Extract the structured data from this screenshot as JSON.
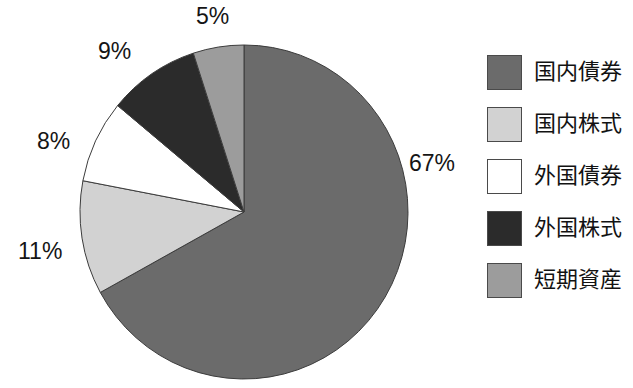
{
  "chart_data": {
    "type": "pie",
    "title": "",
    "subtitle": "",
    "xlabel": "",
    "ylabel": "",
    "legend_position": "right",
    "grid": false,
    "start_angle_deg": 0,
    "direction": "clockwise",
    "categories": [
      "国内債券",
      "国内株式",
      "外国債券",
      "外国株式",
      "短期資産"
    ],
    "values": [
      67,
      11,
      8,
      9,
      5
    ],
    "value_unit": "%",
    "data_labels": [
      "67%",
      "11%",
      "8%",
      "9%",
      "5%"
    ],
    "slice_colors": [
      "#6b6b6b",
      "#d2d2d2",
      "#ffffff",
      "#2b2b2b",
      "#9c9c9c"
    ],
    "slices": [
      {
        "label": "国内債券",
        "value": 67,
        "data_label": "67%",
        "color": "#6b6b6b"
      },
      {
        "label": "国内株式",
        "value": 11,
        "data_label": "11%",
        "color": "#d2d2d2"
      },
      {
        "label": "外国債券",
        "value": 8,
        "data_label": "8%",
        "color": "#ffffff"
      },
      {
        "label": "外国株式",
        "value": 9,
        "data_label": "9%",
        "color": "#2b2b2b"
      },
      {
        "label": "短期資産",
        "value": 5,
        "data_label": "5%",
        "color": "#9c9c9c"
      }
    ]
  },
  "chart": {
    "labels": {
      "pct_67": "67%",
      "pct_11": "11%",
      "pct_8": "8%",
      "pct_9": "9%",
      "pct_5": "5%"
    }
  },
  "legend": {
    "items": [
      {
        "label": "国内債券",
        "color": "#6b6b6b",
        "swatch_name": "legend-swatch-domestic-bonds"
      },
      {
        "label": "国内株式",
        "color": "#d2d2d2",
        "swatch_name": "legend-swatch-domestic-stocks"
      },
      {
        "label": "外国債券",
        "color": "#ffffff",
        "swatch_name": "legend-swatch-foreign-bonds"
      },
      {
        "label": "外国株式",
        "color": "#2b2b2b",
        "swatch_name": "legend-swatch-foreign-stocks"
      },
      {
        "label": "短期資産",
        "color": "#9c9c9c",
        "swatch_name": "legend-swatch-short-term-assets"
      }
    ]
  },
  "style": {
    "background": "#ffffff",
    "text_color": "#151515",
    "slice_outline": "#3c3c3c"
  }
}
